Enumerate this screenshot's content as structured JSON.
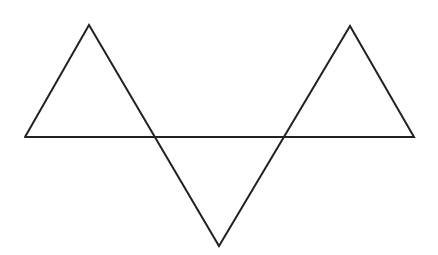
{
  "figure": {
    "width": 438,
    "height": 255,
    "background": "#ffffff",
    "stroke_color": "#222222",
    "stroke_width": 2,
    "polyline_points": [
      [
        25,
        137
      ],
      [
        89,
        25
      ],
      [
        219,
        246
      ],
      [
        350,
        26
      ],
      [
        414,
        137
      ],
      [
        25,
        137
      ]
    ]
  }
}
